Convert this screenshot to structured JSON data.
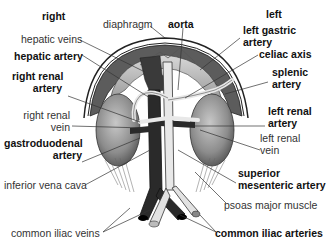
{
  "figure": {
    "colors": {
      "background": "#ffffff",
      "diaphragm_dark": "#5a5a5a",
      "diaphragm_light": "#cfcfcf",
      "kidney": "#8a8a8a",
      "vein": "#2a2a2a",
      "artery": "#e6e6e6",
      "leader_line": "#333333"
    },
    "orientation": {
      "right": "right",
      "left": "left"
    },
    "labels": {
      "right": "right",
      "left": "left",
      "diaphragm": "diaphragm",
      "aorta": "aorta",
      "hepatic_veins": "hepatic veins",
      "hepatic_artery": "hepatic artery",
      "right_renal_artery_1": "right renal",
      "right_renal_artery_2": "artery",
      "right_renal_vein_1": "right renal",
      "right_renal_vein_2": "vein",
      "gastroduodenal_artery_1": "gastroduodenal",
      "gastroduodenal_artery_2": "artery",
      "inferior_vena_cava": "inferior vena cava",
      "common_iliac_veins": "common iliac veins",
      "left_gastric_artery_1": "left gastric",
      "left_gastric_artery_2": "artery",
      "celiac_axis": "celiac axis",
      "splenic_artery_1": "splenic",
      "splenic_artery_2": "artery",
      "left_renal_artery_1": "left renal",
      "left_renal_artery_2": "artery",
      "left_renal_vein_1": "left renal",
      "left_renal_vein_2": "vein",
      "superior_mesenteric_artery_1": "superior",
      "superior_mesenteric_artery_2": "mesenteric artery",
      "psoas_major_muscle": "psoas major muscle",
      "common_iliac_arteries": "common iliac arteries"
    }
  }
}
